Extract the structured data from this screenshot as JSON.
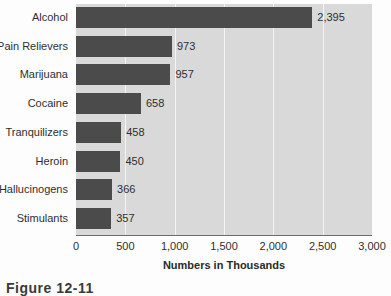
{
  "figure": {
    "caption": "Figure 12-11",
    "background_color": "#fdfdfd"
  },
  "chart_data": {
    "type": "bar",
    "orientation": "horizontal",
    "title": "",
    "xlabel": "Numbers in Thousands",
    "ylabel": "",
    "categories": [
      "Alcohol",
      "Pain Relievers",
      "Marijuana",
      "Cocaine",
      "Tranquilizers",
      "Heroin",
      "Hallucinogens",
      "Stimulants"
    ],
    "values": [
      2395,
      973,
      957,
      658,
      458,
      450,
      366,
      357
    ],
    "value_labels": [
      "2,395",
      "973",
      "957",
      "658",
      "458",
      "450",
      "366",
      "357"
    ],
    "xlim": [
      0,
      3000
    ],
    "xticks": [
      0,
      500,
      1000,
      1500,
      2000,
      2500,
      3000
    ],
    "xtick_labels": [
      "0",
      "500",
      "1,000",
      "1,500",
      "2,000",
      "2,500",
      "3,000"
    ],
    "grid": "vertical",
    "legend": "none",
    "bar_color": "#4b4b4b",
    "plot_background_color": "#d9d9d9",
    "gridline_color": "#f4f4f4"
  }
}
